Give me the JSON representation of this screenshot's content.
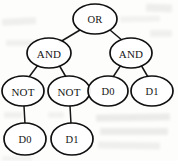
{
  "figure": {
    "width": 178,
    "height": 161,
    "background_color": "#fdfdfc",
    "stroke_color": "#101010",
    "text_color": "#161616"
  },
  "nodes": [
    {
      "id": "n0",
      "label": "OR",
      "cx": 95,
      "cy": 19,
      "rx": 22,
      "ry": 15,
      "level": 0
    },
    {
      "id": "n1",
      "label": "AND",
      "cx": 49,
      "cy": 53,
      "rx": 22,
      "ry": 15,
      "level": 1
    },
    {
      "id": "n2",
      "label": "AND",
      "cx": 131,
      "cy": 53,
      "rx": 21,
      "ry": 15,
      "level": 1
    },
    {
      "id": "n3",
      "label": "NOT",
      "cx": 23,
      "cy": 91,
      "rx": 21,
      "ry": 15,
      "level": 2
    },
    {
      "id": "n4",
      "label": "NOT",
      "cx": 69,
      "cy": 91,
      "rx": 21,
      "ry": 15,
      "level": 2
    },
    {
      "id": "n5",
      "label": "D0",
      "cx": 108,
      "cy": 91,
      "rx": 20,
      "ry": 15,
      "level": 2
    },
    {
      "id": "n6",
      "label": "D1",
      "cx": 152,
      "cy": 91,
      "rx": 21,
      "ry": 15,
      "level": 2
    },
    {
      "id": "n7",
      "label": "D0",
      "cx": 25,
      "cy": 139,
      "rx": 21,
      "ry": 16,
      "level": 3
    },
    {
      "id": "n8",
      "label": "D1",
      "cx": 72,
      "cy": 139,
      "rx": 21,
      "ry": 16,
      "level": 3
    }
  ],
  "edges": [
    {
      "from": "n0",
      "to": "n1",
      "x1": 80,
      "y1": 30,
      "x2": 60,
      "y2": 42
    },
    {
      "from": "n0",
      "to": "n2",
      "x1": 110,
      "y1": 30,
      "x2": 123,
      "y2": 41
    },
    {
      "from": "n1",
      "to": "n3",
      "x1": 38,
      "y1": 65,
      "x2": 29,
      "y2": 77
    },
    {
      "from": "n1",
      "to": "n4",
      "x1": 59,
      "y1": 65,
      "x2": 66,
      "y2": 77
    },
    {
      "from": "n2",
      "to": "n5",
      "x1": 121,
      "y1": 65,
      "x2": 113,
      "y2": 77
    },
    {
      "from": "n2",
      "to": "n6",
      "x1": 141,
      "y1": 65,
      "x2": 148,
      "y2": 77
    },
    {
      "from": "n3",
      "to": "n7",
      "x1": 24,
      "y1": 106,
      "x2": 25,
      "y2": 124
    },
    {
      "from": "n4",
      "to": "n8",
      "x1": 70,
      "y1": 106,
      "x2": 71,
      "y2": 124
    }
  ],
  "smudges": [
    {
      "x": 2,
      "y": 18,
      "w": 34,
      "h": 7,
      "o": 0.055,
      "r": -3
    },
    {
      "x": 6,
      "y": 40,
      "w": 28,
      "h": 6,
      "o": 0.05,
      "r": 0
    },
    {
      "x": 146,
      "y": 4,
      "w": 26,
      "h": 8,
      "o": 0.06,
      "r": 2
    },
    {
      "x": 120,
      "y": 16,
      "w": 40,
      "h": 6,
      "o": 0.045,
      "r": -1
    },
    {
      "x": 150,
      "y": 30,
      "w": 22,
      "h": 7,
      "o": 0.05,
      "r": 0
    },
    {
      "x": 96,
      "y": 114,
      "w": 74,
      "h": 7,
      "o": 0.07,
      "r": -1
    },
    {
      "x": 100,
      "y": 128,
      "w": 68,
      "h": 7,
      "o": 0.065,
      "r": 0
    },
    {
      "x": 98,
      "y": 142,
      "w": 62,
      "h": 7,
      "o": 0.055,
      "r": 1
    },
    {
      "x": 4,
      "y": 112,
      "w": 18,
      "h": 6,
      "o": 0.05,
      "r": 0
    },
    {
      "x": 48,
      "y": 112,
      "w": 16,
      "h": 6,
      "o": 0.045,
      "r": 0
    },
    {
      "x": 2,
      "y": 156,
      "w": 30,
      "h": 5,
      "o": 0.04,
      "r": 0
    }
  ]
}
